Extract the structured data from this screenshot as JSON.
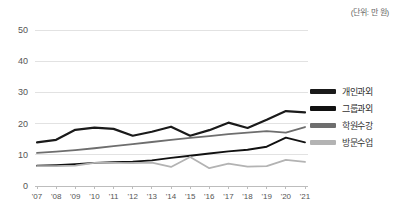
{
  "unit_note": "(단위: 만 원)",
  "legend": {
    "position": "right",
    "items": [
      {
        "label": "개인과외",
        "color": "#1a1a1a"
      },
      {
        "label": "그룹과외",
        "color": "#111111"
      },
      {
        "label": "학원수강",
        "color": "#6e6e6e"
      },
      {
        "label": "방문수업",
        "color": "#b3b3b3"
      }
    ]
  },
  "chart_data": {
    "type": "line",
    "title": "",
    "subtitle": "",
    "xlabel": "",
    "ylabel": "",
    "annotations": [
      "(단위: 만 원)"
    ],
    "grid": true,
    "legend_position": "right",
    "categories": [
      "'07",
      "'08",
      "'09",
      "'10",
      "'11",
      "'12",
      "'13",
      "'14",
      "'15",
      "'16",
      "'17",
      "'18",
      "'19",
      "'20",
      "'21"
    ],
    "x": [
      "'07",
      "'08",
      "'09",
      "'10",
      "'11",
      "'12",
      "'13",
      "'14",
      "'15",
      "'16",
      "'17",
      "'18",
      "'19",
      "'20",
      "'21"
    ],
    "xlim": [
      "'07",
      "'21"
    ],
    "ylim": [
      0,
      50
    ],
    "yticks": [
      0,
      10,
      20,
      30,
      40,
      50
    ],
    "ytick_labels": [
      "0",
      "10",
      "20",
      "30",
      "40",
      "50"
    ],
    "series": [
      {
        "name": "개인과외",
        "color": "#1a1a1a",
        "values": [
          14.0,
          14.8,
          18.0,
          18.7,
          18.3,
          16.1,
          17.4,
          19.0,
          16.1,
          17.9,
          20.3,
          18.6,
          21.2,
          24.0,
          23.6
        ]
      },
      {
        "name": "그룹과외",
        "color": "#111111",
        "values": [
          6.5,
          6.7,
          7.0,
          7.4,
          7.6,
          7.8,
          8.2,
          9.0,
          9.7,
          10.4,
          11.1,
          11.6,
          12.6,
          15.5,
          14.0
        ]
      },
      {
        "name": "학원수강",
        "color": "#6e6e6e",
        "values": [
          10.6,
          11.0,
          11.5,
          12.1,
          12.8,
          13.4,
          14.1,
          14.8,
          15.4,
          16.0,
          16.6,
          17.1,
          17.6,
          17.1,
          18.9
        ]
      },
      {
        "name": "방문수업",
        "color": "#b3b3b3",
        "values": [
          6.4,
          6.4,
          6.5,
          7.4,
          7.4,
          7.3,
          7.5,
          6.1,
          9.3,
          5.7,
          7.2,
          6.2,
          6.4,
          8.4,
          7.7
        ]
      }
    ]
  }
}
